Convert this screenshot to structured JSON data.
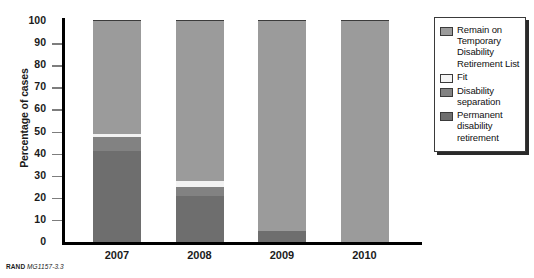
{
  "chart_data": {
    "type": "bar",
    "subtype": "stacked-bar-100",
    "title": "",
    "xlabel": "",
    "ylabel": "Percentage of cases",
    "ylim": [
      0,
      100
    ],
    "yticks": [
      0,
      10,
      20,
      30,
      40,
      50,
      60,
      70,
      80,
      90,
      100
    ],
    "ytick_labels": [
      "0",
      "10",
      "20",
      "30",
      "40",
      "50",
      "60",
      "70",
      "80",
      "90",
      "100"
    ],
    "grid": false,
    "legend_position": "right",
    "categories": [
      "2007",
      "2008",
      "2009",
      "2010"
    ],
    "series": [
      {
        "name": "Permanent disability retirement",
        "color": "#6e6e6e",
        "values": [
          41,
          21,
          5,
          0
        ]
      },
      {
        "name": "Disability separation",
        "color": "#828282",
        "values": [
          6.5,
          4,
          0,
          0
        ]
      },
      {
        "name": "Fit",
        "color": "#f2f2f2",
        "values": [
          1.5,
          2.5,
          0,
          0
        ]
      },
      {
        "name": "Remain on Temporary Disability Retirement List",
        "color": "#9b9b9b",
        "values": [
          51,
          72.5,
          95,
          100
        ]
      }
    ]
  },
  "axes": {
    "y_title": "Percentage of cases",
    "y_tick_labels": [
      "100",
      "90",
      "80",
      "70",
      "60",
      "50",
      "40",
      "30",
      "20",
      "10",
      "0"
    ],
    "x_tick_labels": [
      "2007",
      "2008",
      "2009",
      "2010"
    ]
  },
  "legend": {
    "items": [
      {
        "label": "Remain on Temporary Disability Retirement List",
        "color": "#9b9b9b",
        "swatch_name": "legend-swatch-remain-tdrl"
      },
      {
        "label": "Fit",
        "color": "#f4f4f4",
        "swatch_name": "legend-swatch-fit"
      },
      {
        "label": "Disability separation",
        "color": "#828282",
        "swatch_name": "legend-swatch-disability-separation"
      },
      {
        "label": "Permanent disability retirement",
        "color": "#6e6e6e",
        "swatch_name": "legend-swatch-permanent-disability-retirement"
      }
    ]
  },
  "footer": {
    "source_prefix": "RAND",
    "source_id": "MG1157-3.3"
  },
  "colors": {
    "remain_tdrl": "#9b9b9b",
    "fit": "#f2f2f2",
    "disability_separation": "#828282",
    "permanent_disability_retirement": "#6e6e6e",
    "axis": "#000000",
    "text": "#1b1b1b",
    "background": "#ffffff"
  }
}
